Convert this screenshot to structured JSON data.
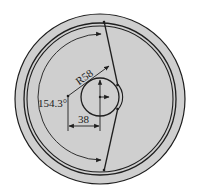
{
  "diagram": {
    "type": "engineering-drawing",
    "colors": {
      "background": "#ffffff",
      "plate_fill": "#cfcfcf",
      "line": "#1e1e1e"
    },
    "dimensions": {
      "radius_label": "R58",
      "angle_label": "154.3°",
      "offset_label": "38"
    },
    "geometry": {
      "outer_circle": {
        "cx": 100,
        "cy": 99,
        "r": 85
      },
      "ring_outer": {
        "cx": 100,
        "cy": 99,
        "r": 76
      },
      "ring_inner": {
        "cx": 100,
        "cy": 99,
        "r": 73
      },
      "small_circle": {
        "cx": 100,
        "cy": 97,
        "r": 19
      },
      "radius_vertex": {
        "x": 68,
        "y": 96
      }
    }
  }
}
